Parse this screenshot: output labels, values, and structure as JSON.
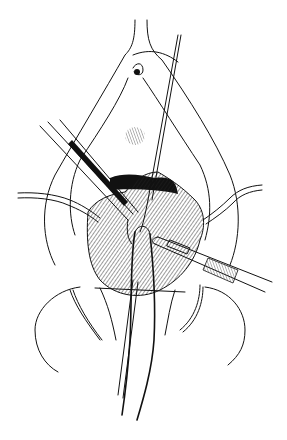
{
  "figure": {
    "type": "surgical-line-illustration",
    "background": "#ffffff",
    "ink": "#111111",
    "elements": [
      "perineum-outline",
      "tissue-mass",
      "forceps",
      "probe",
      "left-retractor",
      "right-retractor",
      "scalpel",
      "catheter",
      "thigh-outlines"
    ]
  }
}
